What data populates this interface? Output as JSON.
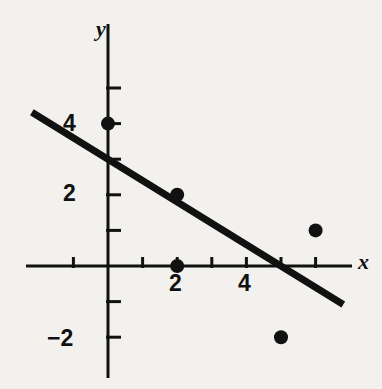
{
  "figure": {
    "background_color": "#f3f1ed",
    "ink_color": "#111111",
    "axis_x_label": "x",
    "axis_y_label": "y"
  },
  "labels": {
    "y_4": "4",
    "y_2": "2",
    "y_neg2": "−2",
    "x_2": "2",
    "x_4": "4"
  },
  "chart_data": {
    "type": "scatter",
    "title": "",
    "subtitle": "",
    "xlabel": "x",
    "ylabel": "y",
    "xlim": [
      -2.6,
      7.4
    ],
    "ylim": [
      -3.2,
      5.8
    ],
    "grid": false,
    "legend": null,
    "axes_style": "cartesian-crosshair",
    "x_ticks": [
      -1,
      1,
      2,
      3,
      4,
      5,
      6
    ],
    "x_tick_labels": [
      "",
      "",
      "2",
      "",
      "4",
      "",
      ""
    ],
    "y_ticks": [
      -2,
      -1,
      1,
      2,
      3,
      4,
      5
    ],
    "y_tick_labels": [
      "−2",
      "",
      "",
      "2",
      "",
      "4",
      ""
    ],
    "series": [
      {
        "name": "data points",
        "type": "scatter",
        "marker": "filled-circle",
        "color": "#111111",
        "points": [
          {
            "x": 0,
            "y": 4
          },
          {
            "x": 2,
            "y": 2
          },
          {
            "x": 2,
            "y": 0
          },
          {
            "x": 5,
            "y": -2
          },
          {
            "x": 6,
            "y": 1
          }
        ]
      },
      {
        "name": "regression line",
        "type": "line",
        "color": "#111111",
        "slope": -0.6,
        "intercept": 3.0,
        "x_start": -2.2,
        "y_start": 4.32,
        "x_end": 6.8,
        "y_end": -1.08
      }
    ]
  }
}
